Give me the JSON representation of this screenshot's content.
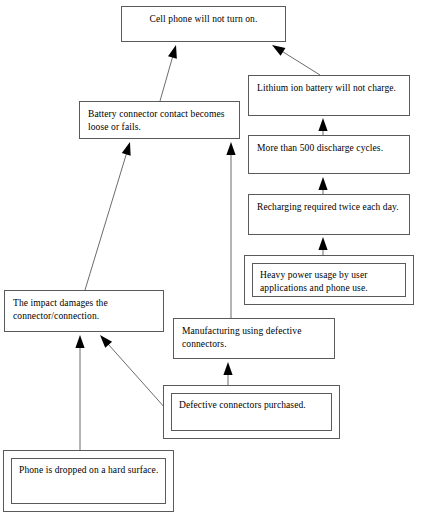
{
  "diagram": {
    "type": "fault-tree",
    "line_color": "#5a5a5a",
    "text_color": "#000000",
    "background_color": "#ffffff",
    "nodes": [
      {
        "id": "top-event",
        "label": "Cell phone will not turn on.",
        "x": 121,
        "y": 6,
        "w": 165,
        "h": 36,
        "double_border": false,
        "align": "center"
      },
      {
        "id": "battery-connector-contact",
        "label": "Battery connector contact becomes loose or fails.",
        "x": 79,
        "y": 101,
        "w": 161,
        "h": 38,
        "double_border": false,
        "align": "left"
      },
      {
        "id": "lithium-ion-battery",
        "label": "Lithium ion battery will not charge.",
        "x": 248,
        "y": 75,
        "w": 162,
        "h": 41,
        "double_border": false,
        "align": "left"
      },
      {
        "id": "discharge-cycles",
        "label": "More than 500 discharge cycles.",
        "x": 248,
        "y": 135,
        "w": 162,
        "h": 39,
        "double_border": false,
        "align": "left"
      },
      {
        "id": "recharging-twice-daily",
        "label": "Recharging required twice each day.",
        "x": 248,
        "y": 194,
        "w": 162,
        "h": 41,
        "double_border": false,
        "align": "left"
      },
      {
        "id": "heavy-power-usage",
        "label": "Heavy power usage by user applications and phone use.",
        "x": 244,
        "y": 255,
        "w": 170,
        "h": 50,
        "double_border": true,
        "align": "left"
      },
      {
        "id": "impact-damages-connector",
        "label": "The impact damages the connector/connection.",
        "x": 4,
        "y": 290,
        "w": 160,
        "h": 42,
        "double_border": false,
        "align": "left"
      },
      {
        "id": "manufacturing-defective",
        "label": "Manufacturing using defective connectors.",
        "x": 173,
        "y": 318,
        "w": 162,
        "h": 41,
        "double_border": false,
        "align": "left"
      },
      {
        "id": "defective-connectors-purchased",
        "label": "Defective connectors purchased.",
        "x": 163,
        "y": 385,
        "w": 177,
        "h": 54,
        "double_border": true,
        "align": "left"
      },
      {
        "id": "phone-dropped",
        "label": "Phone is dropped on a hard surface.",
        "x": 3,
        "y": 450,
        "w": 171,
        "h": 62,
        "double_border": true,
        "align": "left"
      }
    ],
    "edges": [
      {
        "id": "edge-battery-contact-to-top",
        "from": "battery-connector-contact",
        "to": "top-event",
        "x1": 160,
        "y1": 101,
        "x2": 176,
        "y2": 45
      },
      {
        "id": "edge-lithium-to-top",
        "from": "lithium-ion-battery",
        "to": "top-event",
        "x1": 320,
        "y1": 75,
        "x2": 272,
        "y2": 45
      },
      {
        "id": "edge-discharge-to-lithium",
        "from": "discharge-cycles",
        "to": "lithium-ion-battery",
        "x1": 323,
        "y1": 135,
        "x2": 323,
        "y2": 118
      },
      {
        "id": "edge-recharging-to-discharge",
        "from": "recharging-twice-daily",
        "to": "discharge-cycles",
        "x1": 323,
        "y1": 194,
        "x2": 323,
        "y2": 177
      },
      {
        "id": "edge-heavy-usage-to-recharging",
        "from": "heavy-power-usage",
        "to": "recharging-twice-daily",
        "x1": 323,
        "y1": 255,
        "x2": 323,
        "y2": 237
      },
      {
        "id": "edge-manufacturing-to-battery-contact",
        "from": "manufacturing-defective",
        "to": "battery-connector-contact",
        "x1": 231,
        "y1": 318,
        "x2": 231,
        "y2": 142
      },
      {
        "id": "edge-impact-to-battery-contact",
        "from": "impact-damages-connector",
        "to": "battery-connector-contact",
        "x1": 85,
        "y1": 290,
        "x2": 130,
        "y2": 142
      },
      {
        "id": "edge-defective-to-manufacturing",
        "from": "defective-connectors-purchased",
        "to": "manufacturing-defective",
        "x1": 228,
        "y1": 385,
        "x2": 228,
        "y2": 362
      },
      {
        "id": "edge-defective-to-impact",
        "from": "defective-connectors-purchased",
        "to": "impact-damages-connector",
        "x1": 166,
        "y1": 409,
        "x2": 100,
        "y2": 335
      },
      {
        "id": "edge-dropped-to-impact",
        "from": "phone-dropped",
        "to": "impact-damages-connector",
        "x1": 80,
        "y1": 450,
        "x2": 80,
        "y2": 335
      }
    ]
  }
}
